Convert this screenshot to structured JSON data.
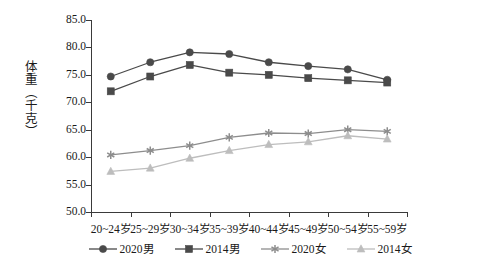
{
  "chart_data": {
    "type": "line",
    "title": "",
    "xlabel": "",
    "ylabel": "体重（千克）",
    "ylim": [
      50.0,
      85.0
    ],
    "yticks": [
      "50.0",
      "55.0",
      "60.0",
      "65.0",
      "70.0",
      "75.0",
      "80.0",
      "85.0"
    ],
    "ytick_values": [
      50.0,
      55.0,
      60.0,
      65.0,
      70.0,
      75.0,
      80.0,
      85.0
    ],
    "grid": false,
    "legend_position": "bottom",
    "categories": [
      "20~24岁",
      "25~29岁",
      "30~34岁",
      "35~39岁",
      "40~44岁",
      "45~49岁",
      "50~54岁",
      "55~59岁"
    ],
    "series": [
      {
        "name": "2020男",
        "marker": "circle",
        "color": "#4a4a4a",
        "values": [
          74.7,
          77.3,
          79.1,
          78.8,
          77.3,
          76.6,
          76.0,
          74.1
        ]
      },
      {
        "name": "2014男",
        "marker": "square",
        "color": "#4a4a4a",
        "values": [
          72.0,
          74.7,
          76.8,
          75.4,
          75.0,
          74.4,
          74.0,
          73.6
        ]
      },
      {
        "name": "2020女",
        "marker": "asterisk",
        "color": "#8d8d8d",
        "values": [
          60.4,
          61.2,
          62.1,
          63.6,
          64.4,
          64.3,
          65.0,
          64.7
        ]
      },
      {
        "name": "2014女",
        "marker": "triangle",
        "color": "#bdbdbd",
        "values": [
          57.4,
          58.0,
          59.8,
          61.2,
          62.3,
          62.8,
          63.9,
          63.3
        ]
      }
    ]
  },
  "axis": {
    "y_title": "体重（千克）"
  }
}
